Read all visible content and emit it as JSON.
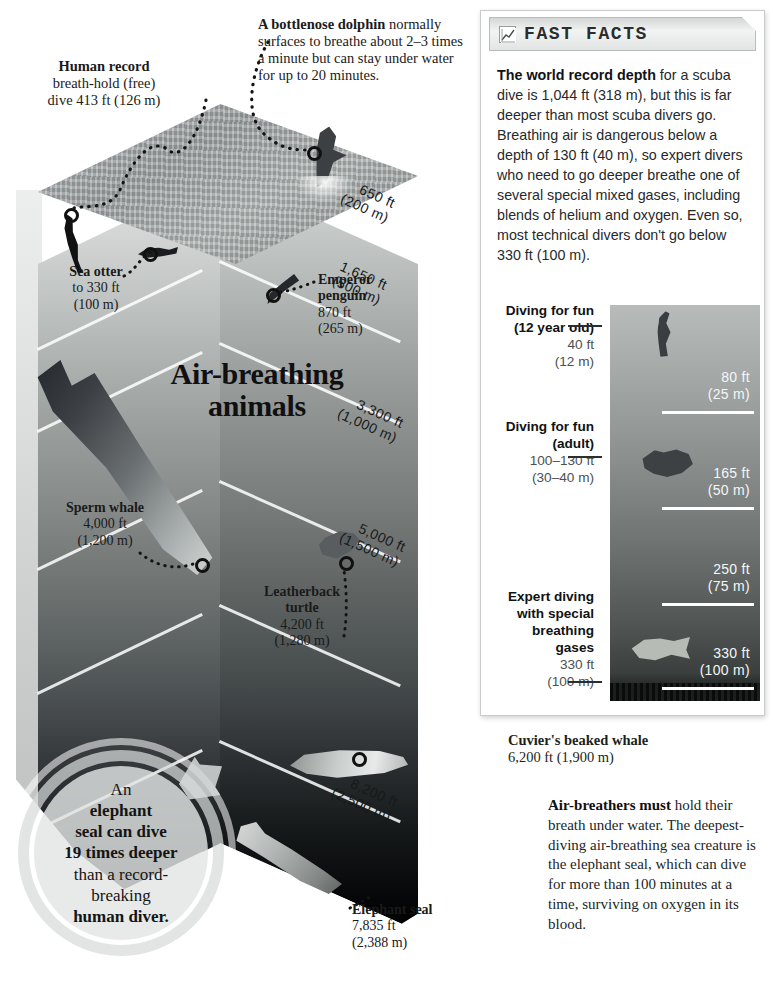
{
  "ocean": {
    "title": "Air-breathing\nanimals",
    "title_line1": "Air-breathing",
    "title_line2": "animals",
    "callouts": {
      "human_record": {
        "title": "Human record",
        "line2": "breath-hold (free)",
        "line3": "dive 413 ft (126 m)"
      },
      "dolphin": {
        "title": "A bottlenose dolphin",
        "body": "normally surfaces to breathe about 2–3 times a minute but can stay under water for up to 20 minutes."
      },
      "sea_otter": {
        "title": "Sea otter",
        "depth_ft": "to 330 ft",
        "depth_m": "(100 m)"
      },
      "emperor_penguin": {
        "title_line1": "Emperor",
        "title_line2": "penguin",
        "depth_ft": "870 ft",
        "depth_m": "(265 m)"
      },
      "sperm_whale": {
        "title": "Sperm whale",
        "depth_ft": "4,000 ft",
        "depth_m": "(1,200 m)"
      },
      "leatherback_turtle": {
        "title_line1": "Leatherback",
        "title_line2": "turtle",
        "depth_ft": "4,200 ft",
        "depth_m": "(1,280 m)"
      },
      "elephant_seal": {
        "title": "Elephant seal",
        "depth_ft": "7,835 ft",
        "depth_m": "(2,388 m)"
      },
      "cuvier_whale": {
        "title": "Cuvier's beaked whale",
        "depth": "6,200 ft (1,900 m)"
      }
    },
    "depth_scale": [
      {
        "ft": "650 ft",
        "m": "(200 m)"
      },
      {
        "ft": "1,650 ft",
        "m": "(500 m)"
      },
      {
        "ft": "3,300 ft",
        "m": "(1,000 m)"
      },
      {
        "ft": "5,000 ft",
        "m": "(1,500 m)"
      },
      {
        "ft": "8,200 ft",
        "m": "(2,500 m)"
      }
    ],
    "badge": {
      "line1": "An",
      "line2": "elephant",
      "line3": "seal can dive",
      "line4": "19 times deeper",
      "line5": "than a record-",
      "line6": "breaking",
      "line7": "human diver."
    }
  },
  "facts_panel": {
    "header_title": "FAST FACTS",
    "header_icon": "chart-icon",
    "body_lead": "The world record depth",
    "body_rest": " for a scuba dive is 1,044 ft (318 m), but this is far deeper than most scuba divers go. Breathing air is dangerous below a depth of 130 ft (40 m), so expert divers who need to go deeper breathe one of several special mixed gases, including blends of helium and oxygen. Even so, most technical divers don't go below 330 ft (100 m)."
  },
  "dive_chart": {
    "type": "bar",
    "title": "Diving depth scale",
    "ylabel": "Depth",
    "ylim": [
      0,
      330
    ],
    "unit_primary": "ft",
    "unit_secondary": "m",
    "ticks": [
      {
        "ft": "80 ft",
        "m": "(25 m)",
        "value_ft": 80,
        "value_m": 25
      },
      {
        "ft": "165 ft",
        "m": "(50 m)",
        "value_ft": 165,
        "value_m": 50
      },
      {
        "ft": "250 ft",
        "m": "(75 m)",
        "value_ft": 250,
        "value_m": 75
      },
      {
        "ft": "330 ft",
        "m": "(100 m)",
        "value_ft": 330,
        "value_m": 100
      }
    ],
    "categories": [
      {
        "label_line1": "Diving for fun",
        "label_line2": "(12 year old)",
        "depth_ft": "40 ft",
        "depth_m": "(12 m)",
        "value_ft": 40,
        "value_m": 12
      },
      {
        "label_line1": "Diving for fun",
        "label_line2": "(adult)",
        "depth_ft": "100–130 ft",
        "depth_m": "(30–40 m)",
        "value_ft": 115,
        "value_m": 35
      },
      {
        "label_line1": "Expert diving",
        "label_line2": "with special",
        "label_line3": "breathing",
        "label_line4": "gases",
        "depth_ft": "330 ft",
        "depth_m": "(100 m)",
        "value_ft": 330,
        "value_m": 100
      }
    ]
  },
  "airbreathers": {
    "lead": "Air-breathers must",
    "rest": " hold their breath under water. The deepest-diving air-breathing sea creature is the elephant seal, which can dive for more than 100 minutes at a time, surviving on oxygen in its blood."
  },
  "colors": {
    "ink": "#1a1a1a",
    "panel_border": "#c8cbca",
    "header_grad_top": "#d4d7d6",
    "water_light": "#b7bbba",
    "water_dark": "#0a0c0c",
    "rule_white": "#ffffff"
  }
}
